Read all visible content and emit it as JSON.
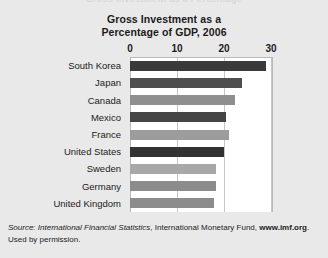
{
  "top_bleed_text": "Gross Investment as a Percentage",
  "source": {
    "label": "Source:",
    "publication": "International Financial Statistics",
    "organization": ", International Monetary Fund,",
    "url": "www.imf.org",
    "permission": ". Used by permission."
  },
  "chart_data": {
    "type": "bar",
    "orientation": "horizontal",
    "title": "Gross Investment as a Percentage of GDP, 2006",
    "title_lines": [
      "Gross Investment as a",
      "Percentage of GDP, 2006"
    ],
    "xlabel": "",
    "ylabel": "",
    "xlim": [
      0,
      30
    ],
    "xticks": [
      0,
      10,
      20,
      30
    ],
    "xtick_labels": [
      "0",
      "10",
      "20",
      "30"
    ],
    "grid": "vertical",
    "legend": "none",
    "categories": [
      "South Korea",
      "Japan",
      "Canada",
      "Mexico",
      "France",
      "United States",
      "Sweden",
      "Germany",
      "United Kingdom"
    ],
    "values": [
      29.0,
      23.8,
      22.3,
      20.5,
      21.0,
      20.0,
      18.3,
      18.3,
      17.8
    ],
    "bar_colors": [
      "#3a3a3a",
      "#4e4e4e",
      "#8f8f8f",
      "#454545",
      "#9c9c9c",
      "#333333",
      "#a8a8a8",
      "#8c8c8c",
      "#8c8c8c"
    ]
  },
  "colors": {
    "page_background": "#e9e9e9",
    "plot_background": "#ffffff",
    "plot_border": "#b9b9b9",
    "gridline": "#c5c5c5",
    "text": "#1b1b1b"
  }
}
